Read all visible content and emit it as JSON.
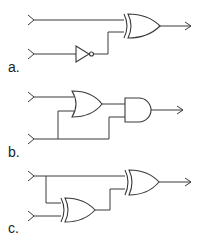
{
  "diagram": {
    "type": "logic-circuits",
    "line_color": "#3a3a3a",
    "circuits": [
      {
        "label": "a.",
        "inputs": 2,
        "gates": [
          "NOT",
          "XOR"
        ],
        "description": "Input 1 goes directly to XOR; input 2 passes through a NOT gate then into XOR; XOR output is the circuit output."
      },
      {
        "label": "b.",
        "inputs": 2,
        "gates": [
          "OR",
          "AND"
        ],
        "description": "Input 1 and input 2 feed an OR gate; OR output and input 2 feed an AND gate; AND output is the circuit output."
      },
      {
        "label": "c.",
        "inputs": 2,
        "gates": [
          "XOR",
          "XOR"
        ],
        "description": "Input 1 and input 2 feed a first XOR gate; input 1 and the first XOR output feed a second XOR gate; its output is the circuit output."
      }
    ]
  }
}
